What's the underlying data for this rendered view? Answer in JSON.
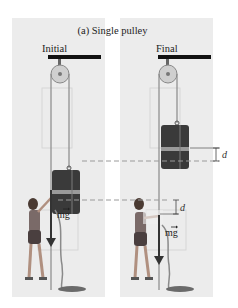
{
  "figure": {
    "title": "(a) Single pulley",
    "panels": [
      {
        "id": "initial",
        "label": "Initial"
      },
      {
        "id": "final",
        "label": "Final"
      }
    ],
    "annotations": {
      "displacement_symbol": "d",
      "weight_vector_label": "mg⃗",
      "weight_vector_text": "mg"
    },
    "colors": {
      "panel_bg": "#ececec",
      "beam": "#111111",
      "rope": "#9a9a9a",
      "suitcase": "#3a3a3a",
      "strap": "#9a9a9a",
      "arrow": "#333333",
      "dashed_line": "#9a9a9a"
    }
  }
}
